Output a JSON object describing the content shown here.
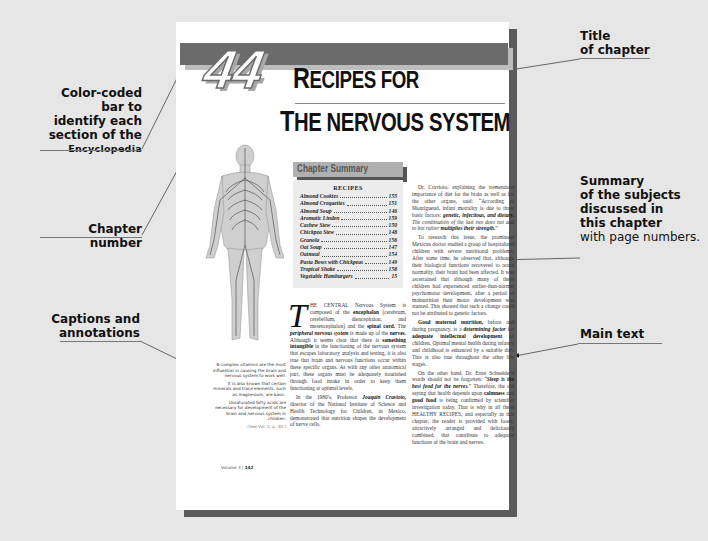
{
  "callouts": {
    "color_bar": {
      "line1": "Color-coded bar to",
      "line2": "identify each",
      "line3": "section of the",
      "line4": "Encyclopedia"
    },
    "chapter_number": "Chapter number",
    "captions": {
      "line1": "Captions and",
      "line2": "annotations"
    },
    "title": {
      "line1": "Title",
      "line2": "of chapter"
    },
    "summary": {
      "line1": "Summary",
      "line2": "of the subjects",
      "line3": "discussed in",
      "line4": "this chapter",
      "line5": "with page numbers."
    },
    "main_text": "Main text"
  },
  "chapter": {
    "number": "44",
    "title_line1_cap": "R",
    "title_line1_rest": "ECIPES FOR",
    "title_line2_cap": "T",
    "title_line2_rest": "HE NERVOUS SYSTEM"
  },
  "summary_box": {
    "header": "Chapter Summary",
    "subheader": "RECIPES",
    "recipes": [
      {
        "name": "Almond Cookies",
        "page": "155"
      },
      {
        "name": "Almond Croquettes",
        "page": "151"
      },
      {
        "name": "Almond Soup",
        "page": "146"
      },
      {
        "name": "Aromatic Linden",
        "page": "159"
      },
      {
        "name": "Cashew Stew",
        "page": "150"
      },
      {
        "name": "Chickpea Stew",
        "page": "148"
      },
      {
        "name": "Granola",
        "page": "156"
      },
      {
        "name": "Oat Soup",
        "page": "147"
      },
      {
        "name": "Oatmeal",
        "page": "154"
      },
      {
        "name": "Pasta Bows with Chickpeas",
        "page": "149"
      },
      {
        "name": "Tropical Shake",
        "page": "158"
      },
      {
        "name": "Vegetable Hamburgers",
        "page": "15"
      }
    ]
  },
  "body": {
    "col1_dropcap": "T",
    "col1_p1_a": "HE CENTRAL Nervous System is composed of the ",
    "col1_p1_b1": "encephalon",
    "col1_p1_c": " (cerebrum, cerebellum, diencephalon, and mesencephalon) and the ",
    "col1_p1_b2": "spinal cord.",
    "col1_p1_d": " The ",
    "col1_p1_b3": "peripheral nervous system",
    "col1_p1_e": " is made up of the ",
    "col1_p1_b4": "nerves.",
    "col1_p1_f": " Although it seems clear that there is ",
    "col1_p1_b5": "something intangible",
    "col1_p1_g": " in the functioning of the nervous system that escapes laboratory analysis and testing, it is also true that brain and nervous functions occur within these specific organs. As with any other anatomical part, these organs must be adequately nourished through food intake in order to keep them functioning at optimal levels.",
    "col1_p2_a": "In the 1980's, Professor ",
    "col1_p2_b": "Joaquin Cravioto,",
    "col1_p2_c": " director of the National Institute of Science and Health Technology for Children, in Mexico, demonstrated that nutrition shapes the development of nerve cells.",
    "col2_p1_a": "Dr. Cravioto, explaining the tremendous importance of diet for the brain as well as for the other organs, said: “According to Monrigueud, infant mortality is due to three basic factors: ",
    "col2_p1_b": "genetic, infectious, and dietary.",
    "col2_p1_c": " The combination of the last two does not add to but rather ",
    "col2_p1_d": "multiplies their strength.",
    "col2_p1_e": "”",
    "col2_p2": "To research this issue, the prominent Mexican doctor studied a group of hospitalized children with severe nutritional problems. After some time, he observed that, although their biological functions recovered to reach normality, their brain had been affected. It was ascertained that although many of these children had experienced earlier-than-normal psychomotor development, after a period of malnutrition their motor development was stunted. This showed that such a change could not be attributed to genetic factors.",
    "col2_p3_a": "Good maternal nutrition,",
    "col2_p3_b": " before and during pregnancy, is a ",
    "col2_p3_c": "determining factor",
    "col2_p3_d": " for ",
    "col2_p3_e": "adequate intellectual development",
    "col2_p3_f": " of children. Optimal mental health during infancy and childhood is enhanced by a suitable diet. This is also true throughout the other life stages.",
    "col2_p4_a": "On the other hand, Dr. Ernst Schneider's words should not be forgotten: “",
    "col2_p4_b": "Sleep is the best food for the nerves.",
    "col2_p4_c": "” Therefore, the old saying that health depends upon ",
    "col2_p4_d": "calmness",
    "col2_p4_e": " and ",
    "col2_p4_f": "good food",
    "col2_p4_g": " is being confirmed by scientific investigation today. That is why in all these HEALTHY RECIPES, and especially in this chapter, the reader is provided with foods, attractively arranged and deliciously combined, that contribute to adequate functions of the brain and nerves."
  },
  "sidebar_note": {
    "p1": "B-complex vitamins are the most influential in causing the brain and nervous system to work well.",
    "p2": "It is also known that certain minerals and trace elements, such as magnesium, are basic.",
    "p3": "Unsaturated fatty acids are necessary for development of the brain and nervous system in children.",
    "ref": "(See Vol. 2, p. 30.)"
  },
  "footer": {
    "volume": "Volume 3 | ",
    "page": "142"
  },
  "colors": {
    "background": "#e6e6e6",
    "bar": "#6b6b6b",
    "page_shadow": "#5a5a5a",
    "summary_box": "#ececec"
  }
}
